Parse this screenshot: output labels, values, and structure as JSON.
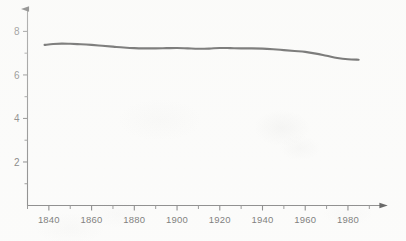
{
  "chart_data": {
    "type": "line",
    "title": "",
    "subtitle": "",
    "xlabel": "",
    "ylabel": "",
    "xlim": [
      1830,
      1995
    ],
    "ylim": [
      0,
      8.8
    ],
    "grid": false,
    "legend": null,
    "axis_style": "arrow-ended axes, ticks outside, no gridlines",
    "x_ticks_major": [
      1840,
      1860,
      1880,
      1900,
      1920,
      1940,
      1960,
      1980
    ],
    "x_tick_labels": [
      "1840",
      "1860",
      "1880",
      "1900",
      "1920",
      "1940",
      "1960",
      "1980"
    ],
    "x_ticks_minor": [
      1830,
      1850,
      1870,
      1890,
      1910,
      1930,
      1950,
      1970,
      1990
    ],
    "y_ticks_major": [
      2,
      4,
      6,
      8
    ],
    "y_tick_labels": [
      "2",
      "4",
      "6",
      "8"
    ],
    "y_ticks_minor": [
      1,
      3,
      5,
      7
    ],
    "series": [
      {
        "name": "series-1",
        "color": "#1c1c1c",
        "x": [
          1838,
          1842,
          1846,
          1850,
          1855,
          1860,
          1865,
          1870,
          1875,
          1880,
          1885,
          1890,
          1895,
          1900,
          1905,
          1910,
          1915,
          1920,
          1925,
          1930,
          1935,
          1940,
          1945,
          1950,
          1955,
          1960,
          1965,
          1970,
          1975,
          1980,
          1985
        ],
        "y": [
          7.38,
          7.42,
          7.44,
          7.43,
          7.41,
          7.38,
          7.34,
          7.3,
          7.26,
          7.23,
          7.22,
          7.22,
          7.23,
          7.24,
          7.22,
          7.2,
          7.21,
          7.24,
          7.23,
          7.22,
          7.22,
          7.21,
          7.18,
          7.14,
          7.1,
          7.06,
          6.98,
          6.88,
          6.78,
          6.72,
          6.7
        ]
      }
    ]
  },
  "figure": {
    "background_color": "#fbfbfa",
    "axis_color": "#6f6f6f",
    "line_color": "#1c1c1c",
    "tick_label_color": "#5b5b5b"
  }
}
